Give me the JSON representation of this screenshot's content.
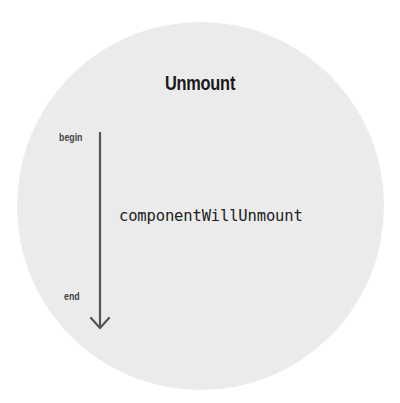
{
  "diagram": {
    "title": "Unmount",
    "timeline": {
      "start_label": "begin",
      "end_label": "end",
      "direction": "down"
    },
    "methods": [
      {
        "name": "componentWillUnmount"
      }
    ],
    "colors": {
      "circle_fill": "#ebebeb",
      "arrow": "#555555",
      "title": "#1a1a1a",
      "text": "#222222"
    }
  }
}
